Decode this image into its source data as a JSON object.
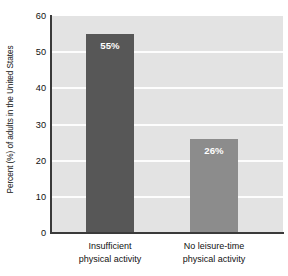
{
  "chart_data": {
    "type": "bar",
    "title": "",
    "xlabel": "",
    "ylabel": "Percent (%) of adults in the United States",
    "ylim": [
      0,
      60
    ],
    "yticks": [
      0,
      10,
      20,
      30,
      40,
      50,
      60
    ],
    "ytick_labels": [
      "0",
      "10",
      "20",
      "30",
      "40",
      "50",
      "60"
    ],
    "grid": true,
    "legend": "none",
    "categories": [
      "Insufficient physical activity",
      "No leisure-time physical activity"
    ],
    "category_lines": [
      [
        "Insufficient",
        "physical activity"
      ],
      [
        "No leisure-time",
        "physical activity"
      ]
    ],
    "values": [
      55,
      26
    ],
    "data_labels": [
      "55%",
      "26%"
    ],
    "bar_colors": [
      "#575757",
      "#8c8c8c"
    ],
    "plot_background": "#e3e3e3",
    "gridline_color": "#fdfdfd",
    "axis_color": "#3a3a3a",
    "label_text_color": "#ffffff"
  }
}
